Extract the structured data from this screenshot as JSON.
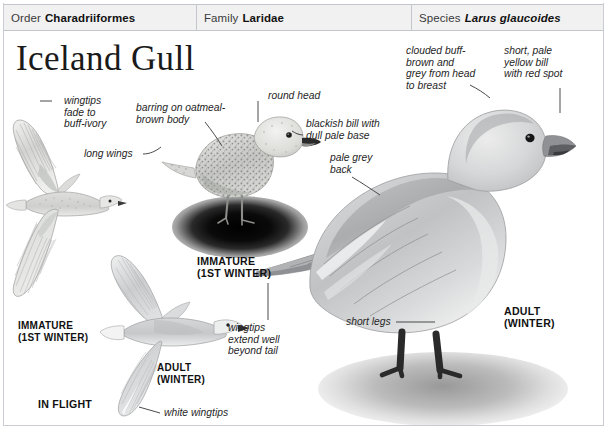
{
  "taxonomy": {
    "order": {
      "label": "Order",
      "value": "Charadriiformes"
    },
    "family": {
      "label": "Family",
      "value": "Laridae"
    },
    "species": {
      "label": "Species",
      "value": "Larus glaucoides"
    }
  },
  "title": "Iceland Gull",
  "annotations": {
    "wingtips_fade": "wingtips\nfade to\nbuff-ivory",
    "long_wings": "long wings",
    "barring_body": "barring on oatmeal-\nbrown body",
    "round_head": "round head",
    "blackish_bill": "blackish bill with\ndull pale base",
    "clouded_head": "clouded buff-\nbrown and\ngrey from head\nto breast",
    "short_bill": "short, pale\nyellow bill\nwith red spot",
    "pale_grey_back": "pale grey\nback",
    "wingtips_extend": "wingtips\nextend well\nbeyond tail",
    "short_legs": "short legs",
    "white_wingtips": "white wingtips"
  },
  "captions": {
    "immature_perched": "IMMATURE\n(1ST WINTER)",
    "immature_flight": "IMMATURE\n(1ST WINTER)",
    "adult_flight": "ADULT\n(WINTER)",
    "adult_standing": "ADULT\n(WINTER)",
    "in_flight": "IN FLIGHT"
  },
  "figures": {
    "immature_flight": "immature-gull-in-flight-illustration",
    "adult_flight": "adult-gull-in-flight-illustration",
    "immature_perched": "immature-gull-perched-photo",
    "adult_standing": "adult-gull-standing-photo"
  },
  "colors": {
    "header_bg": "#f1f1f1",
    "header_border": "#c3c7cb",
    "plate_border": "#c9cdd1",
    "text": "#1b1b1b",
    "leader": "#4a4a4a",
    "bird_grey": "#b9bcbf",
    "bird_light": "#e8e9ea",
    "bird_dark": "#6f7275"
  }
}
